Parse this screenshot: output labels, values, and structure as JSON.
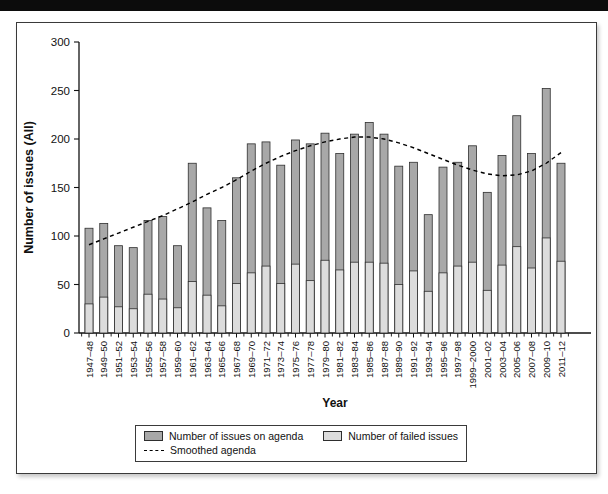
{
  "legend": {
    "agenda_label": "Number of issues on agenda",
    "failed_label": "Number of failed issues",
    "smoothed_label": "Smoothed agenda"
  },
  "chart_data": {
    "type": "bar",
    "subtype": "stacked-bars-with-dashed-trend-line",
    "title": "",
    "xlabel": "Year",
    "ylabel": "Number of issues (All)",
    "ylim": [
      0,
      300
    ],
    "yticks": [
      0,
      50,
      100,
      150,
      200,
      250,
      300
    ],
    "grid": false,
    "legend_position": "bottom-boxed",
    "categories": [
      "1947–48",
      "1949–50",
      "1951–52",
      "1953–54",
      "1955–56",
      "1957–58",
      "1959–60",
      "1961–62",
      "1963–64",
      "1965–66",
      "1967–68",
      "1969–70",
      "1971–72",
      "1973–74",
      "1975–76",
      "1977–78",
      "1979–80",
      "1981–82",
      "1983–84",
      "1985–86",
      "1987–88",
      "1989–90",
      "1991–92",
      "1993–94",
      "1995–96",
      "1997–98",
      "1999–2000",
      "2001–02",
      "2003–04",
      "2005–06",
      "2007–08",
      "2009–10",
      "2011–12"
    ],
    "series": [
      {
        "name": "Number of issues on agenda",
        "role": "bar-total-height",
        "color": "#a8a8a8",
        "values": [
          108,
          113,
          90,
          88,
          116,
          120,
          90,
          175,
          129,
          116,
          160,
          195,
          197,
          173,
          199,
          195,
          206,
          185,
          205,
          217,
          205,
          172,
          176,
          122,
          171,
          176,
          193,
          145,
          183,
          224,
          185,
          252,
          175
        ]
      },
      {
        "name": "Number of failed issues",
        "role": "bar-lower-overlay",
        "color": "#dcdcdc",
        "values": [
          30,
          37,
          27,
          25,
          40,
          35,
          26,
          53,
          39,
          28,
          51,
          62,
          69,
          51,
          71,
          54,
          75,
          65,
          73,
          73,
          72,
          50,
          64,
          43,
          62,
          69,
          73,
          44,
          70,
          89,
          67,
          98,
          74
        ]
      },
      {
        "name": "Smoothed agenda",
        "role": "dashed-line",
        "color": "#000000",
        "values": [
          91,
          97,
          103,
          109,
          115,
          121,
          128,
          135,
          143,
          150,
          158,
          167,
          175,
          182,
          188,
          193,
          197,
          200,
          202,
          202,
          200,
          196,
          191,
          185,
          179,
          173,
          168,
          164,
          162,
          163,
          167,
          175,
          186
        ]
      }
    ]
  }
}
